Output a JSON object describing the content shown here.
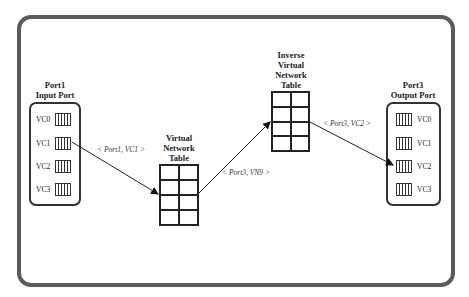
{
  "diagram": {
    "input_port": {
      "title": "Port1\nInput Port",
      "vcs": [
        "VC0",
        "VC1",
        "VC2",
        "VC3"
      ]
    },
    "vnt": {
      "title": "Virtual\nNetwork\nTable",
      "rows": 4,
      "cols": 2
    },
    "ivnt": {
      "title": "Inverse\nVirtual\nNetwork\nTable",
      "rows": 4,
      "cols": 2
    },
    "output_port": {
      "title": "Port3\nOutput Port",
      "vcs": [
        "VC0",
        "VC1",
        "VC2",
        "VC3"
      ]
    },
    "edges": [
      {
        "from": "Port1 VC1",
        "to": "Virtual Network Table",
        "label": "< Port1, VC1 >"
      },
      {
        "from": "Virtual Network Table",
        "to": "Inverse Virtual Network Table",
        "label": "< Port3, VN9 >"
      },
      {
        "from": "Inverse Virtual Network Table",
        "to": "Port3 VC2",
        "label": "< Port3, VC2 >"
      }
    ],
    "colors": {
      "frame": "#5c5c5c",
      "lines": "#222222"
    }
  }
}
